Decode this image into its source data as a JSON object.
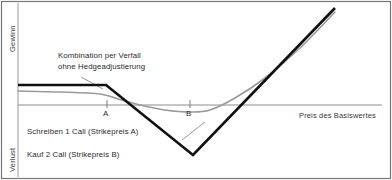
{
  "chart_data": {
    "type": "line",
    "title": "",
    "xlabel": "Preis des Basiswertes",
    "ylabel_top": "Gewinn",
    "ylabel_bottom": "Verlust",
    "xlim": [
      0,
      392
    ],
    "ylim": [
      180,
      0
    ],
    "grid": false,
    "legend_position": "inside-lower-left",
    "zero_line_y": 105,
    "tick_labels": [
      "A",
      "B"
    ],
    "tick_positions_x": [
      107,
      190
    ],
    "annotations": [
      {
        "text_line_1": "Kombination per Verfall",
        "text_line_2": "ohne Hedgeadjustierung",
        "leader_from": [
          80,
          78
        ],
        "leader_to": [
          102,
          88
        ]
      }
    ],
    "series": [
      {
        "name": "Kombination per Verfall (Payoff bei Verfall)",
        "style": "solid-thick-black",
        "color": "#111111",
        "width": 2.6,
        "points": [
          [
            18,
            85
          ],
          [
            106,
            85
          ],
          [
            193,
            155
          ],
          [
            335,
            8
          ]
        ]
      },
      {
        "name": "Kombination vor Verfall (ohne Hedgeadjustierung)",
        "style": "solid-thin-gray",
        "color": "#9a9a9a",
        "width": 1.6,
        "points": [
          [
            18,
            91
          ],
          [
            60,
            92
          ],
          [
            100,
            94
          ],
          [
            118,
            99
          ],
          [
            140,
            105
          ],
          [
            165,
            110
          ],
          [
            190,
            112
          ],
          [
            210,
            110
          ],
          [
            235,
            98
          ],
          [
            265,
            78
          ],
          [
            300,
            48
          ],
          [
            335,
            12
          ]
        ]
      },
      {
        "name": "Nulllinie / x-Achse",
        "style": "solid-hairline-gray",
        "color": "#808080",
        "width": 0.8,
        "points": [
          [
            18,
            105
          ],
          [
            382,
            105
          ]
        ]
      }
    ]
  },
  "labels": {
    "y_axis_gain": "Gewinn",
    "y_axis_loss": "Verlust",
    "x_axis": "Preis des Basiswertes",
    "tick_a": "A",
    "tick_b": "B",
    "annotation_line_1": "Kombination per Verfall",
    "annotation_line_2": "ohne Hedgeadjustierung",
    "legend_line_1": "Schreiben 1 Call (Strikepreis A)",
    "legend_line_2": "Kauf 2 Call (Strikepreis B)"
  },
  "colors": {
    "payoff_line": "#111111",
    "value_line": "#9a9a9a",
    "zero_axis": "#808080",
    "frame": "#777777",
    "text": "#2b2b2b",
    "background": "#ffffff"
  }
}
